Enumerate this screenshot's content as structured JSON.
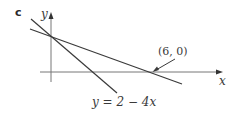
{
  "figure": {
    "part_label": "c",
    "axes": {
      "x_label": "x",
      "y_label": "y"
    },
    "lines": [
      {
        "name": "line-through-6-0",
        "description": "line through (0,2) and (6,0)"
      },
      {
        "name": "line-y-2-minus-4x",
        "equation_label": "y = 2 − 4x"
      }
    ],
    "annotations": [
      {
        "text": "(6, 0)",
        "points_to": "x-intercept of shallower line"
      }
    ],
    "colors": {
      "line": "#3a3a3a",
      "axis": "#777777",
      "background": "#ffffff"
    }
  }
}
